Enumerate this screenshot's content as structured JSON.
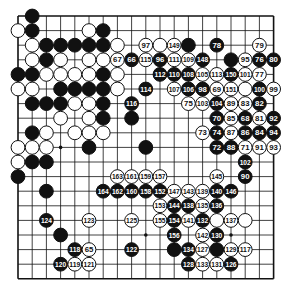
{
  "board": {
    "size": 19,
    "origin_x": 18,
    "origin_y": 16,
    "step_x": 14.2,
    "step_y": 14.6,
    "stone_radius": 6.9,
    "line_color": "#111111",
    "black_color": "#111111",
    "white_color": "#ffffff",
    "hoshi": [
      [
        3,
        3
      ],
      [
        3,
        9
      ],
      [
        3,
        15
      ],
      [
        9,
        3
      ],
      [
        9,
        9
      ],
      [
        9,
        15
      ],
      [
        15,
        3
      ],
      [
        15,
        9
      ],
      [
        15,
        15
      ]
    ]
  },
  "stones": [
    {
      "r": 0,
      "c": 1,
      "color": "B",
      "label": ""
    },
    {
      "r": 1,
      "c": 0,
      "color": "W",
      "label": ""
    },
    {
      "r": 1,
      "c": 1,
      "color": "B",
      "label": ""
    },
    {
      "r": 1,
      "c": 5,
      "color": "W",
      "label": ""
    },
    {
      "r": 1,
      "c": 6,
      "color": "B",
      "label": ""
    },
    {
      "r": 2,
      "c": 1,
      "color": "W",
      "label": ""
    },
    {
      "r": 2,
      "c": 2,
      "color": "B",
      "label": ""
    },
    {
      "r": 2,
      "c": 3,
      "color": "B",
      "label": ""
    },
    {
      "r": 2,
      "c": 4,
      "color": "B",
      "label": ""
    },
    {
      "r": 2,
      "c": 5,
      "color": "B",
      "label": ""
    },
    {
      "r": 2,
      "c": 6,
      "color": "B",
      "label": ""
    },
    {
      "r": 2,
      "c": 7,
      "color": "W",
      "label": ""
    },
    {
      "r": 2,
      "c": 9,
      "color": "W",
      "label": "97"
    },
    {
      "r": 2,
      "c": 10,
      "color": "W",
      "label": ""
    },
    {
      "r": 2,
      "c": 11,
      "color": "W",
      "label": "149"
    },
    {
      "r": 2,
      "c": 12,
      "color": "B",
      "label": ""
    },
    {
      "r": 2,
      "c": 14,
      "color": "B",
      "label": "78"
    },
    {
      "r": 2,
      "c": 17,
      "color": "W",
      "label": "79"
    },
    {
      "r": 3,
      "c": 1,
      "color": "W",
      "label": ""
    },
    {
      "r": 3,
      "c": 2,
      "color": "B",
      "label": ""
    },
    {
      "r": 3,
      "c": 3,
      "color": "W",
      "label": ""
    },
    {
      "r": 3,
      "c": 5,
      "color": "W",
      "label": ""
    },
    {
      "r": 3,
      "c": 6,
      "color": "W",
      "label": ""
    },
    {
      "r": 3,
      "c": 7,
      "color": "W",
      "label": "67"
    },
    {
      "r": 3,
      "c": 8,
      "color": "B",
      "label": "66"
    },
    {
      "r": 3,
      "c": 9,
      "color": "W",
      "label": "115"
    },
    {
      "r": 3,
      "c": 10,
      "color": "B",
      "label": "96"
    },
    {
      "r": 3,
      "c": 11,
      "color": "W",
      "label": "111"
    },
    {
      "r": 3,
      "c": 12,
      "color": "W",
      "label": "109"
    },
    {
      "r": 3,
      "c": 13,
      "color": "B",
      "label": "148"
    },
    {
      "r": 3,
      "c": 15,
      "color": "B",
      "label": ""
    },
    {
      "r": 3,
      "c": 16,
      "color": "W",
      "label": "95"
    },
    {
      "r": 3,
      "c": 17,
      "color": "B",
      "label": "76"
    },
    {
      "r": 3,
      "c": 18,
      "color": "B",
      "label": "80"
    },
    {
      "r": 4,
      "c": 0,
      "color": "B",
      "label": ""
    },
    {
      "r": 4,
      "c": 1,
      "color": "B",
      "label": ""
    },
    {
      "r": 4,
      "c": 2,
      "color": "W",
      "label": ""
    },
    {
      "r": 4,
      "c": 3,
      "color": "W",
      "label": ""
    },
    {
      "r": 4,
      "c": 4,
      "color": "W",
      "label": ""
    },
    {
      "r": 4,
      "c": 5,
      "color": "W",
      "label": ""
    },
    {
      "r": 4,
      "c": 6,
      "color": "B",
      "label": ""
    },
    {
      "r": 4,
      "c": 7,
      "color": "W",
      "label": ""
    },
    {
      "r": 4,
      "c": 10,
      "color": "B",
      "label": "112"
    },
    {
      "r": 4,
      "c": 11,
      "color": "B",
      "label": "110"
    },
    {
      "r": 4,
      "c": 12,
      "color": "B",
      "label": "108"
    },
    {
      "r": 4,
      "c": 13,
      "color": "W",
      "label": "105"
    },
    {
      "r": 4,
      "c": 14,
      "color": "W",
      "label": "113"
    },
    {
      "r": 4,
      "c": 15,
      "color": "B",
      "label": "150"
    },
    {
      "r": 4,
      "c": 16,
      "color": "W",
      "label": "101"
    },
    {
      "r": 4,
      "c": 17,
      "color": "W",
      "label": "77"
    },
    {
      "r": 5,
      "c": 0,
      "color": "W",
      "label": ""
    },
    {
      "r": 5,
      "c": 1,
      "color": "W",
      "label": ""
    },
    {
      "r": 5,
      "c": 3,
      "color": "B",
      "label": ""
    },
    {
      "r": 5,
      "c": 4,
      "color": "B",
      "label": ""
    },
    {
      "r": 5,
      "c": 5,
      "color": "B",
      "label": ""
    },
    {
      "r": 5,
      "c": 6,
      "color": "B",
      "label": ""
    },
    {
      "r": 5,
      "c": 7,
      "color": "W",
      "label": ""
    },
    {
      "r": 5,
      "c": 9,
      "color": "B",
      "label": "114"
    },
    {
      "r": 5,
      "c": 11,
      "color": "W",
      "label": "107"
    },
    {
      "r": 5,
      "c": 12,
      "color": "B",
      "label": "106"
    },
    {
      "r": 5,
      "c": 13,
      "color": "B",
      "label": "98"
    },
    {
      "r": 5,
      "c": 14,
      "color": "W",
      "label": "69"
    },
    {
      "r": 5,
      "c": 15,
      "color": "W",
      "label": "151"
    },
    {
      "r": 5,
      "c": 16,
      "color": "W",
      "label": ""
    },
    {
      "r": 5,
      "c": 17,
      "color": "B",
      "label": "100"
    },
    {
      "r": 5,
      "c": 18,
      "color": "W",
      "label": "99"
    },
    {
      "r": 6,
      "c": 1,
      "color": "B",
      "label": ""
    },
    {
      "r": 6,
      "c": 2,
      "color": "B",
      "label": ""
    },
    {
      "r": 6,
      "c": 3,
      "color": "B",
      "label": ""
    },
    {
      "r": 6,
      "c": 4,
      "color": "W",
      "label": ""
    },
    {
      "r": 6,
      "c": 5,
      "color": "W",
      "label": ""
    },
    {
      "r": 6,
      "c": 6,
      "color": "B",
      "label": ""
    },
    {
      "r": 6,
      "c": 8,
      "color": "B",
      "label": "116"
    },
    {
      "r": 6,
      "c": 12,
      "color": "W",
      "label": "75"
    },
    {
      "r": 6,
      "c": 13,
      "color": "W",
      "label": "103"
    },
    {
      "r": 6,
      "c": 14,
      "color": "B",
      "label": "104"
    },
    {
      "r": 6,
      "c": 15,
      "color": "W",
      "label": "89"
    },
    {
      "r": 6,
      "c": 16,
      "color": "W",
      "label": "83"
    },
    {
      "r": 6,
      "c": 17,
      "color": "B",
      "label": "82"
    },
    {
      "r": 7,
      "c": 3,
      "color": "W",
      "label": ""
    },
    {
      "r": 7,
      "c": 5,
      "color": "W",
      "label": ""
    },
    {
      "r": 7,
      "c": 6,
      "color": "B",
      "label": ""
    },
    {
      "r": 7,
      "c": 8,
      "color": "B",
      "label": ""
    },
    {
      "r": 7,
      "c": 14,
      "color": "B",
      "label": "70"
    },
    {
      "r": 7,
      "c": 15,
      "color": "W",
      "label": "85"
    },
    {
      "r": 7,
      "c": 16,
      "color": "B",
      "label": "68"
    },
    {
      "r": 7,
      "c": 17,
      "color": "W",
      "label": "81"
    },
    {
      "r": 7,
      "c": 18,
      "color": "B",
      "label": "92"
    },
    {
      "r": 8,
      "c": 1,
      "color": "B",
      "label": ""
    },
    {
      "r": 8,
      "c": 2,
      "color": "W",
      "label": ""
    },
    {
      "r": 8,
      "c": 4,
      "color": "W",
      "label": ""
    },
    {
      "r": 8,
      "c": 5,
      "color": "W",
      "label": ""
    },
    {
      "r": 8,
      "c": 6,
      "color": "W",
      "label": ""
    },
    {
      "r": 8,
      "c": 13,
      "color": "W",
      "label": "73"
    },
    {
      "r": 8,
      "c": 14,
      "color": "B",
      "label": "74"
    },
    {
      "r": 8,
      "c": 15,
      "color": "W",
      "label": "87"
    },
    {
      "r": 8,
      "c": 16,
      "color": "B",
      "label": "86"
    },
    {
      "r": 8,
      "c": 17,
      "color": "B",
      "label": "84"
    },
    {
      "r": 8,
      "c": 18,
      "color": "B",
      "label": "94"
    },
    {
      "r": 9,
      "c": 0,
      "color": "W",
      "label": ""
    },
    {
      "r": 9,
      "c": 1,
      "color": "W",
      "label": ""
    },
    {
      "r": 9,
      "c": 2,
      "color": "W",
      "label": ""
    },
    {
      "r": 9,
      "c": 5,
      "color": "B",
      "label": ""
    },
    {
      "r": 9,
      "c": 9,
      "color": "B",
      "label": ""
    },
    {
      "r": 9,
      "c": 14,
      "color": "B",
      "label": "72"
    },
    {
      "r": 9,
      "c": 15,
      "color": "B",
      "label": "88"
    },
    {
      "r": 9,
      "c": 16,
      "color": "W",
      "label": "71"
    },
    {
      "r": 9,
      "c": 17,
      "color": "W",
      "label": "91"
    },
    {
      "r": 9,
      "c": 18,
      "color": "W",
      "label": "93"
    },
    {
      "r": 10,
      "c": 0,
      "color": "W",
      "label": ""
    },
    {
      "r": 10,
      "c": 1,
      "color": "B",
      "label": ""
    },
    {
      "r": 10,
      "c": 2,
      "color": "B",
      "label": ""
    },
    {
      "r": 10,
      "c": 16,
      "color": "B",
      "label": "102"
    },
    {
      "r": 11,
      "c": 0,
      "color": "B",
      "label": ""
    },
    {
      "r": 11,
      "c": 7,
      "color": "W",
      "label": "163"
    },
    {
      "r": 11,
      "c": 8,
      "color": "W",
      "label": "161"
    },
    {
      "r": 11,
      "c": 9,
      "color": "W",
      "label": "159"
    },
    {
      "r": 11,
      "c": 10,
      "color": "W",
      "label": "157"
    },
    {
      "r": 11,
      "c": 14,
      "color": "W",
      "label": "145"
    },
    {
      "r": 11,
      "c": 16,
      "color": "B",
      "label": "90"
    },
    {
      "r": 12,
      "c": 2,
      "color": "B",
      "label": ""
    },
    {
      "r": 12,
      "c": 6,
      "color": "B",
      "label": "164"
    },
    {
      "r": 12,
      "c": 7,
      "color": "B",
      "label": "162"
    },
    {
      "r": 12,
      "c": 8,
      "color": "B",
      "label": "160"
    },
    {
      "r": 12,
      "c": 9,
      "color": "B",
      "label": "158"
    },
    {
      "r": 12,
      "c": 10,
      "color": "B",
      "label": "152"
    },
    {
      "r": 12,
      "c": 11,
      "color": "W",
      "label": "147"
    },
    {
      "r": 12,
      "c": 12,
      "color": "W",
      "label": "143"
    },
    {
      "r": 12,
      "c": 13,
      "color": "W",
      "label": "139"
    },
    {
      "r": 12,
      "c": 14,
      "color": "B",
      "label": "140"
    },
    {
      "r": 12,
      "c": 15,
      "color": "B",
      "label": "146"
    },
    {
      "r": 13,
      "c": 10,
      "color": "W",
      "label": "153"
    },
    {
      "r": 13,
      "c": 11,
      "color": "B",
      "label": "144"
    },
    {
      "r": 13,
      "c": 12,
      "color": "B",
      "label": "138"
    },
    {
      "r": 13,
      "c": 13,
      "color": "W",
      "label": "135"
    },
    {
      "r": 13,
      "c": 14,
      "color": "B",
      "label": "136"
    },
    {
      "r": 14,
      "c": 2,
      "color": "B",
      "label": "124"
    },
    {
      "r": 14,
      "c": 5,
      "color": "W",
      "label": "123"
    },
    {
      "r": 14,
      "c": 8,
      "color": "W",
      "label": "125"
    },
    {
      "r": 14,
      "c": 10,
      "color": "W",
      "label": "155"
    },
    {
      "r": 14,
      "c": 11,
      "color": "B",
      "label": "154"
    },
    {
      "r": 14,
      "c": 12,
      "color": "W",
      "label": "141"
    },
    {
      "r": 14,
      "c": 13,
      "color": "B",
      "label": "132"
    },
    {
      "r": 14,
      "c": 14,
      "color": "W",
      "label": ""
    },
    {
      "r": 14,
      "c": 15,
      "color": "W",
      "label": "137"
    },
    {
      "r": 14,
      "c": 16,
      "color": "W",
      "label": ""
    },
    {
      "r": 15,
      "c": 3,
      "color": "B",
      "label": ""
    },
    {
      "r": 15,
      "c": 11,
      "color": "B",
      "label": "156"
    },
    {
      "r": 15,
      "c": 13,
      "color": "W",
      "label": "142"
    },
    {
      "r": 15,
      "c": 14,
      "color": "B",
      "label": "130"
    },
    {
      "r": 16,
      "c": 4,
      "color": "B",
      "label": "118"
    },
    {
      "r": 16,
      "c": 5,
      "color": "W",
      "label": "65"
    },
    {
      "r": 16,
      "c": 8,
      "color": "B",
      "label": "122"
    },
    {
      "r": 16,
      "c": 11,
      "color": "B",
      "label": ""
    },
    {
      "r": 16,
      "c": 12,
      "color": "B",
      "label": "134"
    },
    {
      "r": 16,
      "c": 13,
      "color": "W",
      "label": "127"
    },
    {
      "r": 16,
      "c": 14,
      "color": "B",
      "label": ""
    },
    {
      "r": 16,
      "c": 15,
      "color": "W",
      "label": "129"
    },
    {
      "r": 16,
      "c": 16,
      "color": "W",
      "label": "117"
    },
    {
      "r": 17,
      "c": 3,
      "color": "B",
      "label": "120"
    },
    {
      "r": 17,
      "c": 4,
      "color": "W",
      "label": "119"
    },
    {
      "r": 17,
      "c": 5,
      "color": "W",
      "label": "121"
    },
    {
      "r": 17,
      "c": 12,
      "color": "B",
      "label": "128"
    },
    {
      "r": 17,
      "c": 13,
      "color": "W",
      "label": "133"
    },
    {
      "r": 17,
      "c": 14,
      "color": "W",
      "label": "131"
    },
    {
      "r": 17,
      "c": 15,
      "color": "B",
      "label": "126"
    }
  ]
}
